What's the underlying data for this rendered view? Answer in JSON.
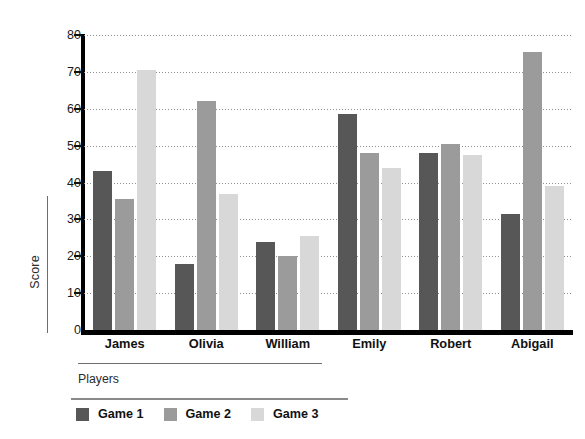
{
  "chart_data": {
    "type": "bar",
    "title": "",
    "xlabel": "Players",
    "ylabel": "Score",
    "categories": [
      "James",
      "Olivia",
      "William",
      "Emily",
      "Robert",
      "Abigail"
    ],
    "series": [
      {
        "name": "Game 1",
        "color": "#575757",
        "values": [
          43,
          18,
          24,
          58.5,
          48,
          31.5
        ]
      },
      {
        "name": "Game 2",
        "color": "#9b9b9b",
        "values": [
          35.5,
          62,
          20,
          48,
          50.5,
          75.5
        ]
      },
      {
        "name": "Game 3",
        "color": "#d8d8d8",
        "values": [
          70.5,
          37,
          25.5,
          44,
          47.5,
          39
        ]
      }
    ],
    "ylim": [
      0,
      80
    ],
    "yticks": [
      0,
      10,
      20,
      30,
      40,
      50,
      60,
      70,
      80
    ],
    "ytick_labels": [
      "0",
      "10",
      "20",
      "30",
      "40",
      "50",
      "60",
      "70",
      "80"
    ],
    "grid": true,
    "grid_style": "dotted",
    "legend_position": "bottom-left",
    "orientation": "vertical",
    "grouping": "grouped"
  },
  "axis": {
    "y_title": "Score",
    "x_title": "Players"
  },
  "legend": {
    "entries": [
      {
        "label": "Game 1",
        "color": "#575757"
      },
      {
        "label": "Game 2",
        "color": "#9b9b9b"
      },
      {
        "label": "Game 3",
        "color": "#d8d8d8"
      }
    ]
  }
}
